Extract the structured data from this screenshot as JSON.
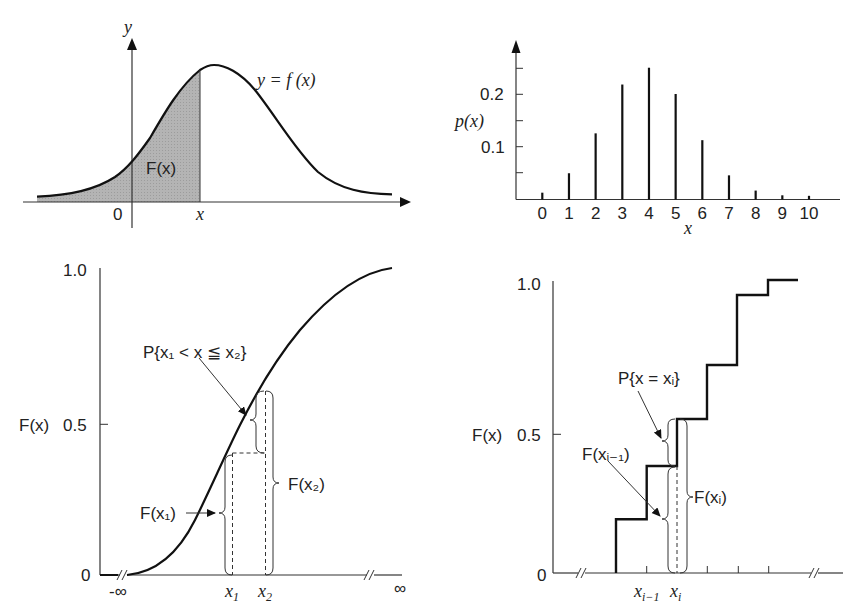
{
  "panels": {
    "pdf_continuous": {
      "y_axis_label": "y",
      "curve_label": "y = f (x)",
      "area_label": "F(x)",
      "origin_label": "0",
      "x_marker_label": "x",
      "shade_color": "#b4b4b4"
    },
    "pmf_discrete": {
      "y_axis_label": "p(x)",
      "x_axis_label": "x",
      "y_ticks": [
        "0.1",
        "0.2"
      ],
      "x_ticks": [
        "0",
        "1",
        "2",
        "3",
        "4",
        "5",
        "6",
        "7",
        "8",
        "9",
        "10"
      ]
    },
    "cdf_continuous": {
      "y_axis_label": "F(x)",
      "y_ticks": {
        "zero": "0",
        "half": "0.5",
        "one": "1.0"
      },
      "x_left_label": "-∞",
      "x_right_label": "∞",
      "x1_label": "x",
      "x1_sub": "1",
      "x2_label": "x",
      "x2_sub": "2",
      "prob_annotation": "P{x₁ < x ≦ x₂}",
      "fx1_annotation": "F(x₁)",
      "fx2_annotation": "F(x₂)"
    },
    "cdf_discrete": {
      "y_axis_label": "F(x)",
      "y_ticks": {
        "zero": "0",
        "half": "0.5",
        "one": "1.0"
      },
      "xi_minus_label": "x",
      "xi_minus_sub": "i−1",
      "xi_label": "x",
      "xi_sub": "i",
      "prob_annotation": "P{x = xᵢ}",
      "fxi_minus_annotation": "F(xᵢ₋₁)",
      "fxi_annotation": "F(xᵢ)"
    }
  },
  "chart_data": [
    {
      "type": "area",
      "title": "Probability density function y = f(x) with shaded cumulative area F(x)",
      "xlabel": "x",
      "ylabel": "y",
      "description": "Bell-shaped density curve; area left of x shaded and labeled F(x)",
      "grid": false
    },
    {
      "type": "bar",
      "title": "Probability mass function p(x)",
      "xlabel": "x",
      "ylabel": "p(x)",
      "categories": [
        "0",
        "1",
        "2",
        "3",
        "4",
        "5",
        "6",
        "7",
        "8",
        "9",
        "10"
      ],
      "values": [
        0.013,
        0.05,
        0.126,
        0.219,
        0.251,
        0.201,
        0.113,
        0.046,
        0.017,
        0.008,
        0.007
      ],
      "ylim": [
        0,
        0.27
      ],
      "y_ticks": [
        0.05,
        0.1,
        0.15,
        0.2,
        0.25
      ],
      "y_tick_labels": [
        "0.1",
        "0.2"
      ],
      "grid": false
    },
    {
      "type": "line",
      "title": "Continuous cumulative distribution function F(x)",
      "xlabel": "x",
      "ylabel": "F(x)",
      "x_tick_labels": [
        "-∞",
        "x₁",
        "x₂",
        "∞"
      ],
      "y_tick_labels": [
        "0",
        "0.5",
        "1.0"
      ],
      "ylim": [
        0,
        1.0
      ],
      "annotations": [
        "P{x₁ < x ≦ x₂}",
        "F(x₁)",
        "F(x₂)"
      ],
      "points": {
        "F_x1": 0.39,
        "F_x2": 0.59
      },
      "grid": false
    },
    {
      "type": "line",
      "title": "Discrete cumulative distribution function F(x) (step function)",
      "xlabel": "x",
      "ylabel": "F(x)",
      "x_tick_labels": [
        "xᵢ₋₁",
        "xᵢ"
      ],
      "y_tick_labels": [
        "0",
        "0.5",
        "1.0"
      ],
      "ylim": [
        0,
        1.0
      ],
      "step_levels": [
        0.18,
        0.36,
        0.53,
        0.71,
        0.95,
        1.0
      ],
      "annotations": [
        "P{x = xᵢ}",
        "F(xᵢ₋₁)",
        "F(xᵢ)"
      ],
      "grid": false
    }
  ]
}
